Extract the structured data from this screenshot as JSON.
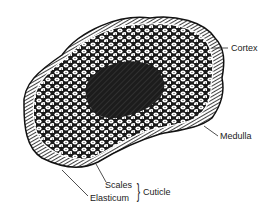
{
  "diagram": {
    "labels": {
      "cortex": "Cortex",
      "medulla": "Medulla",
      "scales": "Scales",
      "elasticum": "Elasticum",
      "cuticle": "Cuticle",
      "brace": "}"
    },
    "colors": {
      "ink": "#1a1a1a",
      "background": "#ffffff",
      "medulla_fill": "#2a2a2a"
    }
  }
}
